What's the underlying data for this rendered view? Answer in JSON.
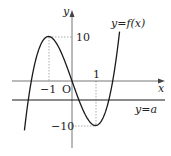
{
  "diagram": {
    "type": "function-graph",
    "function_label": "y=f(x)",
    "line_label": "y=a",
    "axis_labels": {
      "x": "x",
      "y": "y",
      "origin": "O"
    },
    "tick_labels": {
      "x_neg1": "−1",
      "x_pos1": "1",
      "y_pos10": "10",
      "y_neg10": "−10"
    },
    "key_points": [
      {
        "name": "local-max",
        "x": -1,
        "y": 10
      },
      {
        "name": "local-min",
        "x": 1,
        "y": -10
      }
    ],
    "colors": {
      "curve": "#1a1a1a",
      "axis": "#555555",
      "line_a": "#1a1a1a",
      "guide": "#888888"
    }
  }
}
